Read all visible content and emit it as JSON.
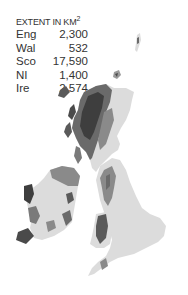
{
  "legend": {
    "title": "EXTENT IN KM",
    "title_superscript": "2",
    "rows": [
      {
        "region": "Eng",
        "value": "2,300"
      },
      {
        "region": "Wal",
        "value": "532"
      },
      {
        "region": "Sco",
        "value": "17,590"
      },
      {
        "region": "NI",
        "value": "1,400"
      },
      {
        "region": "Ire",
        "value": "2,574"
      }
    ]
  },
  "map": {
    "colors": {
      "land": "#dcdcdc",
      "medium": "#9a9a9a",
      "dark": "#4a4a4a",
      "background": "#ffffff"
    }
  }
}
